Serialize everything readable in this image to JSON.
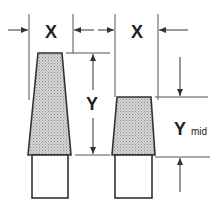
{
  "diagram": {
    "labels": {
      "x_left": "X",
      "x_right": "X",
      "y": "Y",
      "y_mid": "Y",
      "y_mid_subscript": "mid"
    },
    "colors": {
      "line": "#333333",
      "fill": "#c8c8c8",
      "background": "#ffffff"
    }
  }
}
